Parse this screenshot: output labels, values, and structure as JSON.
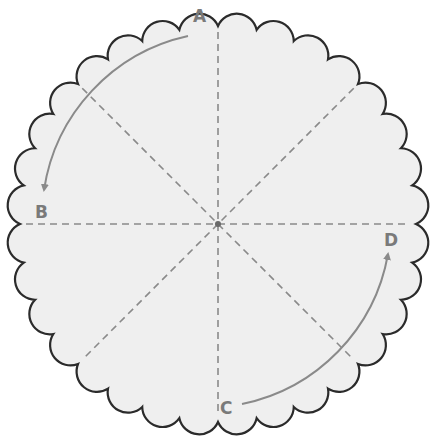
{
  "diagram": {
    "center": {
      "x": 218,
      "y": 224
    },
    "radius": 198,
    "scallop_count": 32,
    "colors": {
      "fill": "#efefef",
      "outline": "#2b2b2b",
      "fold_line": "#8a8a8a",
      "arrow": "#8a8a8a",
      "label": "#7a7a7a"
    },
    "fold_lines": [
      {
        "name": "vertical",
        "angle": 90
      },
      {
        "name": "horizontal",
        "angle": 0
      },
      {
        "name": "diagonal-1",
        "angle": 45
      },
      {
        "name": "diagonal-2",
        "angle": 135
      }
    ],
    "labels": [
      {
        "id": "A",
        "text": "A",
        "x": 200,
        "y": 22
      },
      {
        "id": "B",
        "text": "B",
        "x": 40,
        "y": 218
      },
      {
        "id": "C",
        "text": "C",
        "x": 226,
        "y": 413
      },
      {
        "id": "D",
        "text": "D",
        "x": 391,
        "y": 244
      }
    ],
    "arrows": [
      {
        "from": "A",
        "to": "B",
        "description": "fold from A to B"
      },
      {
        "from": "C",
        "to": "D",
        "description": "fold from C to D"
      }
    ]
  }
}
